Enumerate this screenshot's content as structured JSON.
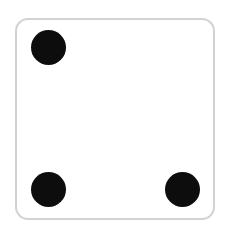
{
  "scene": {
    "width": 231,
    "height": 234,
    "background_color": "#ffffff",
    "caption": ""
  },
  "die": {
    "name": "die-face",
    "value": 3,
    "face_color": "#ffffff",
    "border_color": "#d2d2d2",
    "border_width": 2,
    "corner_radius": 13,
    "x": 15,
    "y": 18,
    "width": 200,
    "height": 202,
    "pip_color": "#0d0d0d",
    "pip_diameter": 35,
    "pips": [
      {
        "slot": "top-left",
        "name": "pip-top-left",
        "visible": true,
        "center_x": 48,
        "center_y": 47
      },
      {
        "slot": "top-right",
        "name": "pip-top-right",
        "visible": false,
        "center_x": 182,
        "center_y": 47
      },
      {
        "slot": "mid-left",
        "name": "pip-mid-left",
        "visible": false,
        "center_x": 48,
        "center_y": 118
      },
      {
        "slot": "center",
        "name": "pip-center",
        "visible": false,
        "center_x": 115,
        "center_y": 118
      },
      {
        "slot": "mid-right",
        "name": "pip-mid-right",
        "visible": false,
        "center_x": 182,
        "center_y": 118
      },
      {
        "slot": "bottom-left",
        "name": "pip-bottom-left",
        "visible": true,
        "center_x": 48,
        "center_y": 189
      },
      {
        "slot": "bottom-right",
        "name": "pip-bottom-right",
        "visible": true,
        "center_x": 182,
        "center_y": 189
      }
    ]
  }
}
